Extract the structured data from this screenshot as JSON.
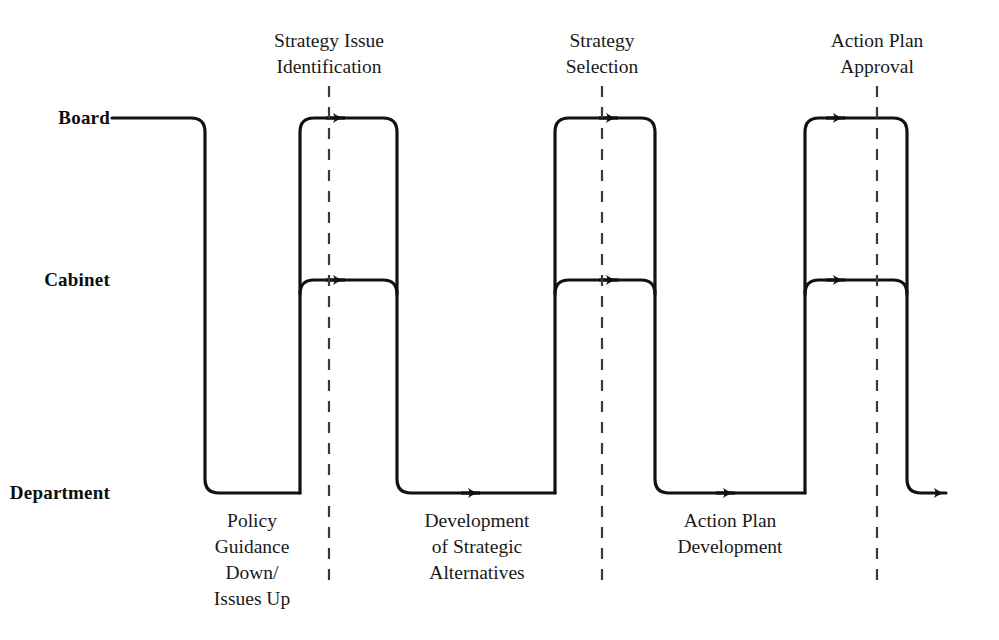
{
  "diagram": {
    "type": "swimlane-process-flow",
    "title": "",
    "stroke_color": "#111111",
    "dashed_color": "#3a3a3a",
    "background": "#ffffff"
  },
  "lanes": [
    {
      "id": "board",
      "label": "Board",
      "y": 118
    },
    {
      "id": "cabinet",
      "label": "Cabinet",
      "y": 280
    },
    {
      "id": "department",
      "label": "Department",
      "y": 493
    }
  ],
  "milestones": [
    {
      "id": "strategy-issue-identification",
      "label": "Strategy Issue\nIdentification",
      "x": 329
    },
    {
      "id": "strategy-selection",
      "label": "Strategy\nSelection",
      "x": 602
    },
    {
      "id": "action-plan-approval",
      "label": "Action Plan\nApproval",
      "x": 877
    }
  ],
  "activities": [
    {
      "id": "policy-guidance",
      "label": "Policy\nGuidance\nDown/\nIssues Up",
      "x": 252
    },
    {
      "id": "strategic-alternatives",
      "label": "Development\nof Strategic\nAlternatives",
      "x": 477
    },
    {
      "id": "action-plan-development",
      "label": "Action Plan\nDevelopment",
      "x": 730
    }
  ],
  "arrows": [
    {
      "id": "board-arrow-1",
      "lane": "board",
      "x": 345
    },
    {
      "id": "board-arrow-2",
      "lane": "board",
      "x": 618
    },
    {
      "id": "board-arrow-3",
      "lane": "board",
      "x": 845
    },
    {
      "id": "cabinet-arrow-1",
      "lane": "cabinet",
      "x": 345
    },
    {
      "id": "cabinet-arrow-2",
      "lane": "cabinet",
      "x": 618
    },
    {
      "id": "cabinet-arrow-3",
      "lane": "cabinet",
      "x": 845
    },
    {
      "id": "department-arrow-1",
      "lane": "department",
      "x": 480
    },
    {
      "id": "department-arrow-2",
      "lane": "department",
      "x": 735
    },
    {
      "id": "department-arrow-exit",
      "lane": "department",
      "x": 955
    }
  ]
}
